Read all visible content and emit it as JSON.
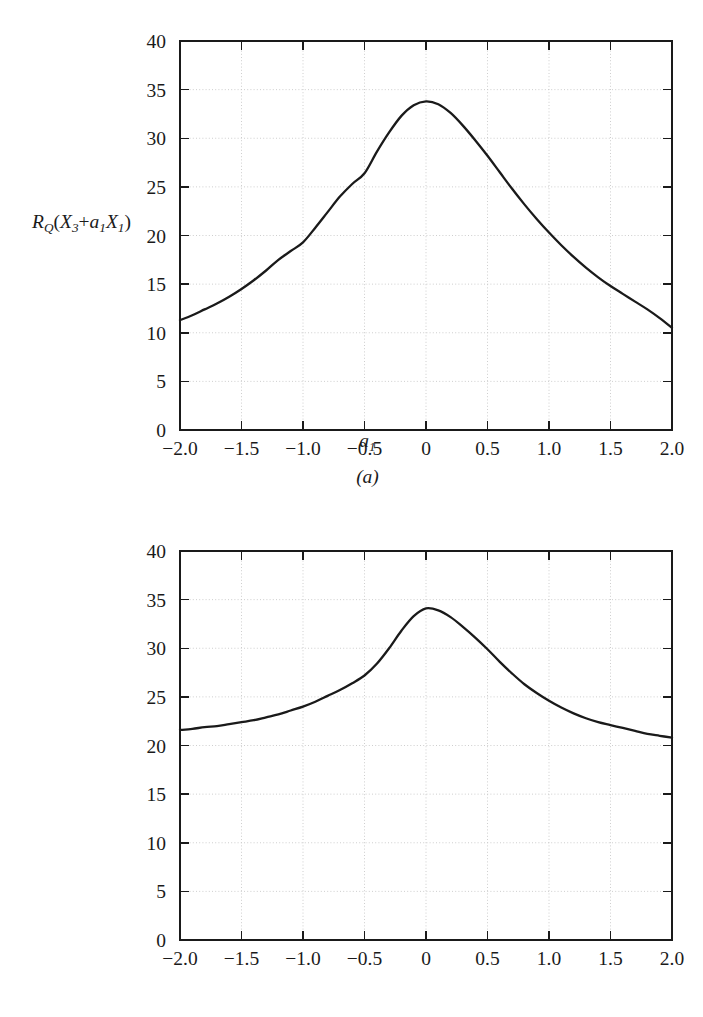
{
  "figure": {
    "background_color": "#ffffff",
    "ink_color": "#1a1a1a",
    "grid_color": "#c8c8c8"
  },
  "chart_data": [
    {
      "type": "line",
      "panel": "a",
      "caption": "(a)",
      "title": "",
      "xlabel": "a₁",
      "xlabel_parts": {
        "base": "a",
        "sub": "1"
      },
      "ylabel": "R_Q(X₃+a₁X₁)",
      "ylabel_parts": {
        "r": "R",
        "r_sub": "Q",
        "open": "(",
        "x1": "X",
        "x1_sub": "3",
        "plus": "+",
        "a": "a",
        "a_sub": "1",
        "x2": "X",
        "x2_sub": "1",
        "close": ")"
      },
      "xlim": [
        -2.0,
        2.0
      ],
      "ylim": [
        0,
        40
      ],
      "xticks": [
        -2.0,
        -1.5,
        -1.0,
        -0.5,
        0,
        0.5,
        1.0,
        1.5,
        2.0
      ],
      "xticklabels": [
        "−2.0",
        "−1.5",
        "−1.0",
        "−0.5",
        "0",
        "0.5",
        "1.0",
        "1.5",
        "2.0"
      ],
      "yticks": [
        0,
        5,
        10,
        15,
        20,
        25,
        30,
        35,
        40
      ],
      "yticklabels": [
        "0",
        "5",
        "10",
        "15",
        "20",
        "25",
        "30",
        "35",
        "40"
      ],
      "grid": true,
      "legend": "none",
      "x": [
        -2.0,
        -1.9,
        -1.8,
        -1.7,
        -1.6,
        -1.5,
        -1.4,
        -1.3,
        -1.2,
        -1.1,
        -1.0,
        -0.9,
        -0.8,
        -0.7,
        -0.6,
        -0.5,
        -0.4,
        -0.3,
        -0.2,
        -0.1,
        0.0,
        0.1,
        0.2,
        0.3,
        0.4,
        0.5,
        0.6,
        0.7,
        0.8,
        0.9,
        1.0,
        1.1,
        1.2,
        1.3,
        1.4,
        1.5,
        1.6,
        1.7,
        1.8,
        1.9,
        2.0
      ],
      "values": [
        11.3,
        11.8,
        12.4,
        13.0,
        13.7,
        14.5,
        15.4,
        16.4,
        17.5,
        18.4,
        19.3,
        20.8,
        22.4,
        24.0,
        25.3,
        26.4,
        28.6,
        30.6,
        32.3,
        33.4,
        33.8,
        33.5,
        32.6,
        31.3,
        29.8,
        28.2,
        26.5,
        24.8,
        23.2,
        21.7,
        20.3,
        19.0,
        17.8,
        16.7,
        15.7,
        14.8,
        14.0,
        13.2,
        12.4,
        11.5,
        10.5
      ],
      "peak": {
        "x": 0.0,
        "y": 33.8
      },
      "endpoints": {
        "left": 11.3,
        "right": 10.5
      }
    },
    {
      "type": "line",
      "panel": "b",
      "caption": "(b)",
      "title": "",
      "xlabel": "a₂",
      "xlabel_parts": {
        "base": "a",
        "sub": "2"
      },
      "ylabel": "R_Q(X₃+a₂X₂)",
      "ylabel_parts": {
        "r": "R",
        "r_sub": "Q",
        "open": "(",
        "x1": "X",
        "x1_sub": "3",
        "plus": "+",
        "a": "a",
        "a_sub": "2",
        "x2": "X",
        "x2_sub": "2",
        "close": ")"
      },
      "xlim": [
        -2.0,
        2.0
      ],
      "ylim": [
        0,
        40
      ],
      "xticks": [
        -2.0,
        -1.5,
        -1.0,
        -0.5,
        0,
        0.5,
        1.0,
        1.5,
        2.0
      ],
      "xticklabels": [
        "−2.0",
        "−1.5",
        "−1.0",
        "−0.5",
        "0",
        "0.5",
        "1.0",
        "1.5",
        "2.0"
      ],
      "yticks": [
        0,
        5,
        10,
        15,
        20,
        25,
        30,
        35,
        40
      ],
      "yticklabels": [
        "0",
        "5",
        "10",
        "15",
        "20",
        "25",
        "30",
        "35",
        "40"
      ],
      "grid": true,
      "legend": "none",
      "x": [
        -2.0,
        -1.9,
        -1.8,
        -1.7,
        -1.6,
        -1.5,
        -1.4,
        -1.3,
        -1.2,
        -1.1,
        -1.0,
        -0.9,
        -0.8,
        -0.7,
        -0.6,
        -0.5,
        -0.4,
        -0.3,
        -0.2,
        -0.1,
        0.0,
        0.1,
        0.2,
        0.3,
        0.4,
        0.5,
        0.6,
        0.7,
        0.8,
        0.9,
        1.0,
        1.1,
        1.2,
        1.3,
        1.4,
        1.5,
        1.6,
        1.7,
        1.8,
        1.9,
        2.0
      ],
      "values": [
        21.6,
        21.7,
        21.9,
        22.0,
        22.2,
        22.4,
        22.6,
        22.9,
        23.2,
        23.6,
        24.0,
        24.5,
        25.1,
        25.7,
        26.4,
        27.2,
        28.4,
        30.0,
        31.8,
        33.3,
        34.1,
        33.9,
        33.2,
        32.2,
        31.1,
        29.9,
        28.6,
        27.4,
        26.3,
        25.4,
        24.6,
        23.9,
        23.3,
        22.8,
        22.4,
        22.1,
        21.8,
        21.5,
        21.2,
        21.0,
        20.8
      ],
      "peak": {
        "x": 0.0,
        "y": 34.1
      },
      "endpoints": {
        "left": 21.6,
        "right": 20.8
      }
    }
  ]
}
